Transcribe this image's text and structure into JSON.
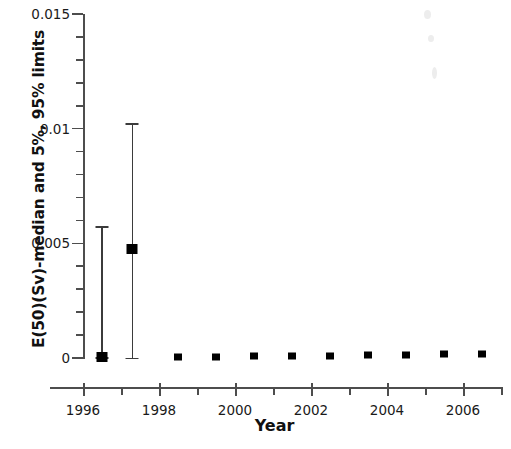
{
  "chart_data": {
    "type": "scatter",
    "title": "",
    "xlabel": "Year",
    "ylabel": "E(50)(Sv)-median and 5%, 95% limits",
    "xlim": [
      1996,
      2007
    ],
    "ylim": [
      0,
      0.015
    ],
    "grid": false,
    "legend": null,
    "x_major_ticks": [
      1996,
      1998,
      2000,
      2002,
      2004,
      2006
    ],
    "x_major_tick_labels": [
      "1996",
      "1998",
      "2000",
      "2002",
      "2004",
      "2006"
    ],
    "x_minor_ticks": [
      1997,
      1999,
      2001,
      2003,
      2005,
      2007
    ],
    "y_major_ticks": [
      0,
      0.005,
      0.01,
      0.015
    ],
    "y_major_tick_labels": [
      "0",
      "0.005",
      "0.01",
      "0.015"
    ],
    "y_minor_tick_step": 0.001,
    "marker_style": "filled-square",
    "marker_color": "#000000",
    "errorbar_color": "#3b3b3b",
    "series": [
      {
        "name": "E(50)(Sv) median with 5% and 95% limits",
        "x": [
          1996.5,
          1997.3,
          1998.5,
          1999.5,
          2000.5,
          2001.5,
          2002.5,
          2003.5,
          2004.5,
          2005.5,
          2006.5
        ],
        "median": [
          4e-05,
          0.00475,
          5e-05,
          6e-05,
          7e-05,
          9e-05,
          0.0001,
          0.00012,
          0.00014,
          0.00016,
          0.00018
        ],
        "low_5pct": [
          4e-05,
          2e-05,
          null,
          null,
          null,
          null,
          null,
          null,
          null,
          null,
          null
        ],
        "high_95pct": [
          0.00575,
          0.01025,
          null,
          null,
          null,
          null,
          null,
          null,
          null,
          null,
          null
        ]
      }
    ]
  },
  "axes": {
    "x_title": "Year",
    "y_title": "E(50)(Sv)-median and 5%, 95% limits"
  }
}
